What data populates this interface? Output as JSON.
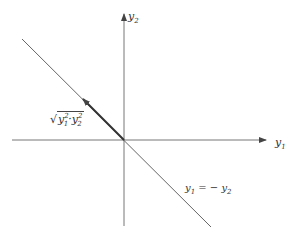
{
  "diagram": {
    "type": "coordinate-plane",
    "axes": {
      "horizontal": {
        "label_var": "y",
        "label_sub": "1"
      },
      "vertical": {
        "label_var": "y",
        "label_sub": "2"
      }
    },
    "line": {
      "label_lhs_var": "y",
      "label_lhs_sub": "1",
      "label_eq": " = − ",
      "label_rhs_var": "y",
      "label_rhs_sub": "2"
    },
    "vector": {
      "label_root": "√",
      "label_a_var": "y",
      "label_a_sub": "1",
      "label_a_sup": "2",
      "label_op": "·",
      "label_b_var": "y",
      "label_b_sub": "2",
      "label_b_sup": "2"
    },
    "colors": {
      "line": "#555555",
      "vector": "#333333",
      "axis": "#666666"
    }
  }
}
